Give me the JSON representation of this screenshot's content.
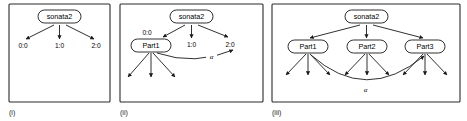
{
  "figure": {
    "type": "diagram",
    "background_color": "#ffffff",
    "line_color": "#1a1a1a",
    "panel_border_color": "#2b2b2b"
  },
  "panels": [
    {
      "caption": "(i)",
      "root": {
        "label": "sonata2",
        "shape": "rounded-rect"
      },
      "children": [
        {
          "label": "0:0"
        },
        {
          "label": "1:0"
        },
        {
          "label": "2:0"
        }
      ],
      "expanded_nodes": [],
      "alpha_edge": null
    },
    {
      "caption": "(ii)",
      "root": {
        "label": "sonata2",
        "shape": "rounded-rect"
      },
      "children": [
        {
          "label": "0:0"
        },
        {
          "label": "1:0"
        },
        {
          "label": "2:0"
        }
      ],
      "expanded_nodes": [
        {
          "label": "Part1",
          "shape": "rounded-rect",
          "out_degree": 3
        }
      ],
      "alpha_edge": {
        "label": "α",
        "from": "Part1",
        "to": "2:0"
      }
    },
    {
      "caption": "(iii)",
      "root": {
        "label": "sonata2",
        "shape": "rounded-rect"
      },
      "children": [],
      "expanded_nodes": [
        {
          "label": "Part1",
          "shape": "rounded-rect",
          "out_degree": 3
        },
        {
          "label": "Part2",
          "shape": "rounded-rect",
          "out_degree": 3
        },
        {
          "label": "Part3",
          "shape": "rounded-rect",
          "out_degree": 3
        }
      ],
      "alpha_edge": {
        "label": "α",
        "from": "Part1",
        "to": "Part3"
      }
    }
  ],
  "labels": {
    "root_name": "sonata2",
    "child_0": "0:0",
    "child_1": "1:0",
    "child_2": "2:0",
    "part_1": "Part1",
    "part_2": "Part2",
    "part_3": "Part3",
    "alpha": "α",
    "caption_i": "(i)",
    "caption_ii": "(ii)",
    "caption_iii": "(iii)"
  }
}
